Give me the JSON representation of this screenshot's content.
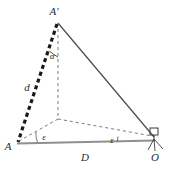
{
  "figure": {
    "title": "",
    "type": "geometric-survey-diagram",
    "colors": {
      "stroke_solid": "#4a4a4a",
      "stroke_dashed": "#6b6b6b",
      "stroke_thick_dashed": "#1a1a1a",
      "baseline": "#8a8a8a",
      "label": "#2b2b2b"
    },
    "points": {
      "apex": {
        "label": "A'",
        "x": 58,
        "y": 22
      },
      "left": {
        "label": "A",
        "x": 17,
        "y": 143
      },
      "right": {
        "label": "O",
        "x": 155,
        "y": 140
      },
      "foot": {
        "label": "",
        "x": 58,
        "y": 119
      }
    },
    "segments": {
      "slant_distance": {
        "label": "d"
      },
      "horizontal_distance": {
        "label": "D"
      }
    },
    "angles": {
      "zenith": {
        "label": "α"
      },
      "at_left": {
        "label": "ε"
      },
      "at_right": {
        "label": "ε"
      }
    },
    "markers": {
      "right_angle": "right-angle-square",
      "instrument": "theodolite-tripod"
    }
  }
}
